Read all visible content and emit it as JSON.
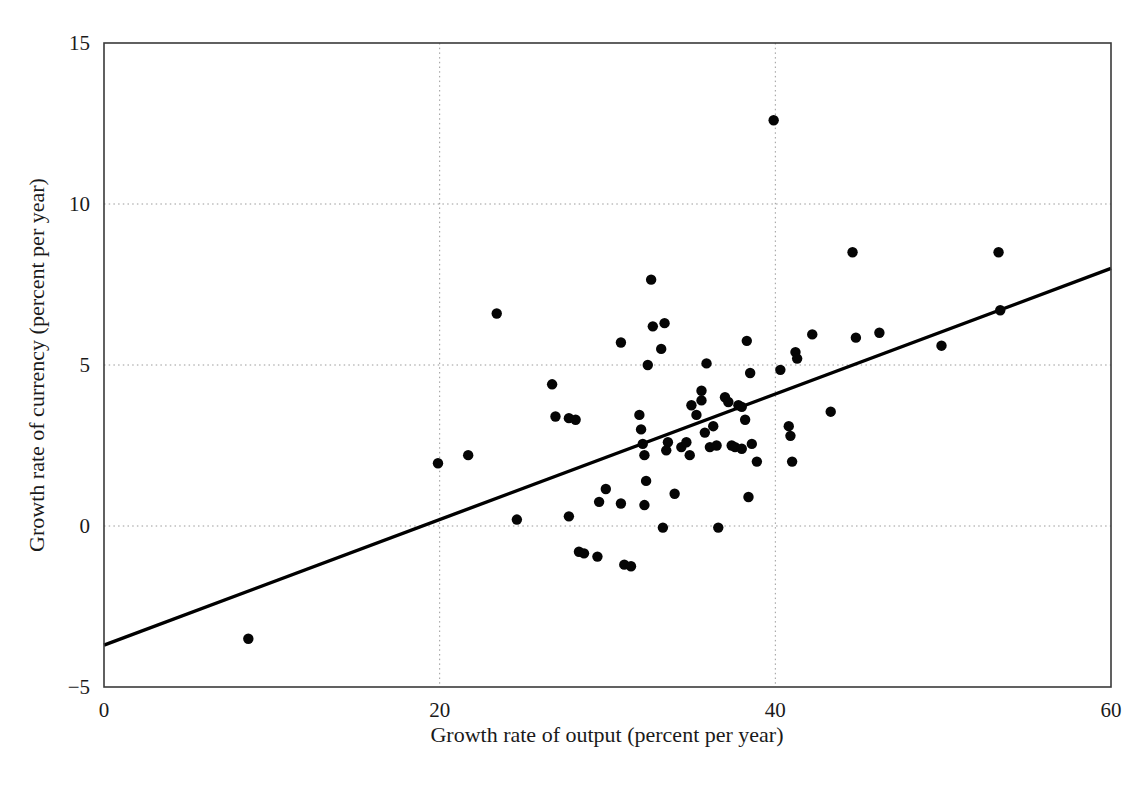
{
  "figure": {
    "background_color": "#ffffff",
    "ink_color": "#1a1a1a",
    "point_color": "#050505",
    "gridline_color": "#9a9a9a",
    "frame_color": "#3a3a3a"
  },
  "axes": {
    "x_title": "Growth rate of output (percent per year)",
    "y_title": "Growth rate of currency (percent per year)",
    "x_ticks": [
      {
        "value": 0,
        "label": "0"
      },
      {
        "value": 20,
        "label": "20"
      },
      {
        "value": 40,
        "label": "40"
      },
      {
        "value": 60,
        "label": "60"
      }
    ],
    "y_ticks": [
      {
        "value": -5,
        "label": "−5"
      },
      {
        "value": 0,
        "label": "0"
      },
      {
        "value": 5,
        "label": "5"
      },
      {
        "value": 10,
        "label": "10"
      },
      {
        "value": 15,
        "label": "15"
      }
    ]
  },
  "chart_data": {
    "type": "scatter",
    "title": "",
    "xlabel": "Growth rate of output (percent per year)",
    "ylabel": "Growth rate of currency (percent per year)",
    "xlim": [
      0,
      60
    ],
    "ylim": [
      -5,
      15
    ],
    "grid": true,
    "grid_style": "dotted",
    "legend": "none",
    "marker": "filled-circle",
    "marker_size_px": 5.2,
    "trendline": {
      "type": "linear-fit",
      "x_start": 0,
      "y_start": -3.7,
      "x_end": 60,
      "y_end": 8.0,
      "slope": 0.195,
      "intercept": -3.7,
      "color": "#000000"
    },
    "points": [
      {
        "x": 8.6,
        "y": -3.5
      },
      {
        "x": 19.9,
        "y": 1.95
      },
      {
        "x": 21.7,
        "y": 2.2
      },
      {
        "x": 23.4,
        "y": 6.6
      },
      {
        "x": 24.6,
        "y": 0.2
      },
      {
        "x": 26.7,
        "y": 4.4
      },
      {
        "x": 26.9,
        "y": 3.4
      },
      {
        "x": 27.7,
        "y": 3.35
      },
      {
        "x": 28.1,
        "y": 3.3
      },
      {
        "x": 27.7,
        "y": 0.3
      },
      {
        "x": 28.3,
        "y": -0.8
      },
      {
        "x": 28.6,
        "y": -0.85
      },
      {
        "x": 29.4,
        "y": -0.95
      },
      {
        "x": 29.5,
        "y": 0.75
      },
      {
        "x": 29.9,
        "y": 1.15
      },
      {
        "x": 30.8,
        "y": 0.7
      },
      {
        "x": 31.0,
        "y": -1.2
      },
      {
        "x": 31.4,
        "y": -1.25
      },
      {
        "x": 30.8,
        "y": 5.7
      },
      {
        "x": 31.9,
        "y": 3.45
      },
      {
        "x": 32.0,
        "y": 3.0
      },
      {
        "x": 32.1,
        "y": 2.55
      },
      {
        "x": 32.2,
        "y": 2.2
      },
      {
        "x": 32.4,
        "y": 5.0
      },
      {
        "x": 32.3,
        "y": 1.4
      },
      {
        "x": 32.2,
        "y": 0.65
      },
      {
        "x": 32.7,
        "y": 6.2
      },
      {
        "x": 32.6,
        "y": 7.65
      },
      {
        "x": 33.4,
        "y": 6.3
      },
      {
        "x": 33.2,
        "y": 5.5
      },
      {
        "x": 33.6,
        "y": 2.6
      },
      {
        "x": 33.5,
        "y": 2.35
      },
      {
        "x": 33.3,
        "y": -0.05
      },
      {
        "x": 34.0,
        "y": 1.0
      },
      {
        "x": 34.4,
        "y": 2.45
      },
      {
        "x": 34.7,
        "y": 2.6
      },
      {
        "x": 34.9,
        "y": 2.2
      },
      {
        "x": 35.0,
        "y": 3.75
      },
      {
        "x": 35.3,
        "y": 3.45
      },
      {
        "x": 35.6,
        "y": 4.2
      },
      {
        "x": 35.6,
        "y": 3.9
      },
      {
        "x": 35.9,
        "y": 5.05
      },
      {
        "x": 35.8,
        "y": 2.9
      },
      {
        "x": 36.1,
        "y": 2.45
      },
      {
        "x": 36.3,
        "y": 3.1
      },
      {
        "x": 36.5,
        "y": 2.5
      },
      {
        "x": 36.6,
        "y": -0.05
      },
      {
        "x": 37.0,
        "y": 4.0
      },
      {
        "x": 37.2,
        "y": 3.85
      },
      {
        "x": 37.4,
        "y": 2.5
      },
      {
        "x": 37.6,
        "y": 2.45
      },
      {
        "x": 37.8,
        "y": 3.75
      },
      {
        "x": 38.0,
        "y": 3.7
      },
      {
        "x": 38.0,
        "y": 2.4
      },
      {
        "x": 38.2,
        "y": 3.3
      },
      {
        "x": 38.3,
        "y": 5.75
      },
      {
        "x": 38.5,
        "y": 4.75
      },
      {
        "x": 38.6,
        "y": 2.55
      },
      {
        "x": 38.4,
        "y": 0.9
      },
      {
        "x": 38.9,
        "y": 2.0
      },
      {
        "x": 39.9,
        "y": 12.6
      },
      {
        "x": 40.3,
        "y": 4.85
      },
      {
        "x": 40.8,
        "y": 3.1
      },
      {
        "x": 40.9,
        "y": 2.8
      },
      {
        "x": 41.2,
        "y": 5.4
      },
      {
        "x": 41.3,
        "y": 5.2
      },
      {
        "x": 41.0,
        "y": 2.0
      },
      {
        "x": 42.2,
        "y": 5.95
      },
      {
        "x": 43.3,
        "y": 3.55
      },
      {
        "x": 44.6,
        "y": 8.5
      },
      {
        "x": 44.8,
        "y": 5.85
      },
      {
        "x": 46.2,
        "y": 6.0
      },
      {
        "x": 49.9,
        "y": 5.6
      },
      {
        "x": 53.3,
        "y": 8.5
      },
      {
        "x": 53.4,
        "y": 6.7
      }
    ]
  }
}
